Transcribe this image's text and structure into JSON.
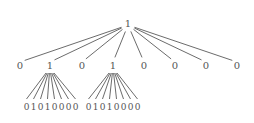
{
  "diagram": {
    "type": "tree",
    "root": {
      "label": "1",
      "x": 128,
      "y": 24
    },
    "children": [
      {
        "label": "0",
        "x": 20,
        "y": 66
      },
      {
        "label": "1",
        "x": 50,
        "y": 66
      },
      {
        "label": "0",
        "x": 82,
        "y": 66
      },
      {
        "label": "1",
        "x": 113,
        "y": 66
      },
      {
        "label": "0",
        "x": 144,
        "y": 66
      },
      {
        "label": "0",
        "x": 175,
        "y": 66
      },
      {
        "label": "0",
        "x": 206,
        "y": 66
      },
      {
        "label": "0",
        "x": 237,
        "y": 66
      }
    ],
    "subtrees": [
      {
        "parent_index": 1,
        "leaves": "01010000",
        "leaf_digits": [
          "0",
          "1",
          "0",
          "1",
          "0",
          "0",
          "0",
          "0"
        ],
        "leaves_x_start": 23,
        "leaves_x_end": 79,
        "leaves_y": 110
      },
      {
        "parent_index": 3,
        "leaves": "01010000",
        "leaf_digits": [
          "0",
          "1",
          "0",
          "1",
          "0",
          "0",
          "0",
          "0"
        ],
        "leaves_x_start": 85,
        "leaves_x_end": 141,
        "leaves_y": 110
      }
    ]
  },
  "colors": {
    "edge": "#5a5a5a",
    "text": "#555555",
    "background": "#ffffff"
  }
}
